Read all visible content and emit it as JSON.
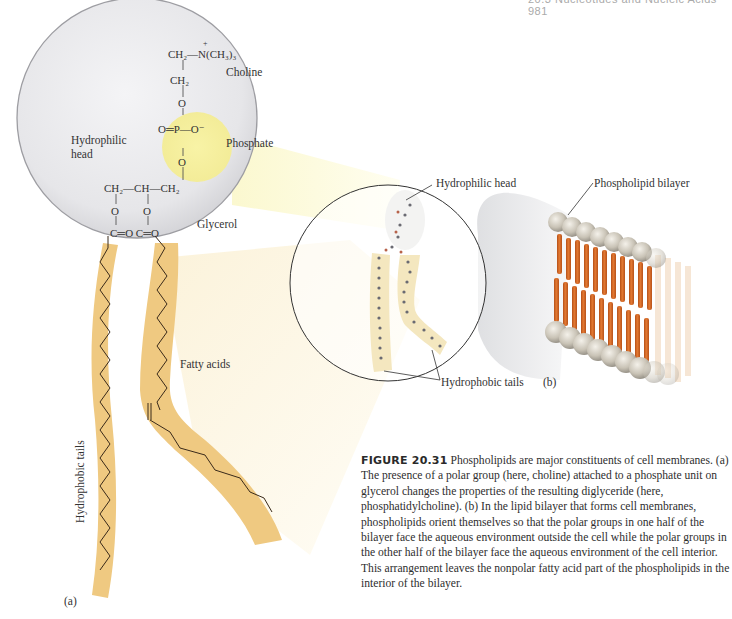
{
  "running_header": {
    "section": "20.3 Nucleotides and Nucleic Acids",
    "page": "981"
  },
  "panel_a": {
    "label": "(a)",
    "labels": {
      "hydrophilic_head_line1": "Hydrophilic",
      "hydrophilic_head_line2": "head",
      "choline": "Choline",
      "phosphate": "Phosphate",
      "glycerol": "Glycerol",
      "fatty_acids": "Fatty acids",
      "hydrophobic_tails": "Hydrophobic tails"
    },
    "structure": {
      "choline_n": "CH₂—N(CH₃)₃",
      "choline_plus": "+",
      "choline_ch2": "CH₂",
      "o_top": "O",
      "phosphate_row": "O═P—O⁻",
      "o_bottom": "O",
      "glycerol_row": "CH₂—CH—CH₂",
      "ester_o1": "O",
      "ester_o2": "O",
      "carbonyl_row": "C═O  C═O"
    },
    "colors": {
      "head_circle": "#e3e3e6",
      "phosphate_highlight": "#f5f0a3",
      "tail_fill": "#efc981",
      "bond_line": "#3a2a1a"
    }
  },
  "panel_middle": {
    "labels": {
      "hydrophilic_head": "Hydrophilic head",
      "hydrophobic_tails": "Hydrophobic tails"
    }
  },
  "panel_b": {
    "label": "(b)",
    "labels": {
      "phospholipid_bilayer": "Phospholipid bilayer"
    },
    "colors": {
      "head_sphere": "#c9c3b6",
      "tail_rod": "#d8692a"
    }
  },
  "caption": {
    "figure_number": "FIGURE 20.31",
    "text": "Phospholipids are major constituents of cell membranes. (a) The presence of a polar group (here, choline) attached to a phosphate unit on glycerol changes the properties of the resulting diglyceride (here, phosphatidylcholine). (b) In the lipid bilayer that forms cell membranes, phospholipids orient themselves so that the polar groups in one half of the bilayer face the aqueous environment outside the cell while the polar groups in the other half of the bilayer face the aqueous environment of the cell interior. This arrangement leaves the nonpolar fatty acid part of the phospholipids in the interior of the bilayer."
  }
}
